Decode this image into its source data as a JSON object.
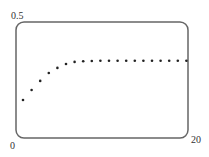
{
  "chart_data": {
    "type": "scatter",
    "title": "",
    "xlabel": "",
    "ylabel": "",
    "xlim": [
      0,
      20
    ],
    "ylim": [
      0,
      0.5
    ],
    "grid": false,
    "legend": null,
    "tick_labels": {
      "y_top": "0.5",
      "origin": "0",
      "x_right": "20"
    },
    "series": [
      {
        "name": "points",
        "x": [
          1,
          2,
          3,
          4,
          5,
          6,
          7,
          8,
          9,
          10,
          11,
          12,
          13,
          14,
          15,
          16,
          17,
          18,
          19,
          20
        ],
        "y": [
          0.164,
          0.207,
          0.246,
          0.28,
          0.302,
          0.319,
          0.328,
          0.331,
          0.332,
          0.333,
          0.333,
          0.333,
          0.333,
          0.333,
          0.333,
          0.333,
          0.333,
          0.333,
          0.333,
          0.333
        ]
      }
    ]
  },
  "colors": {
    "frame": "#666666",
    "points": "#222222",
    "text": "#333333"
  }
}
